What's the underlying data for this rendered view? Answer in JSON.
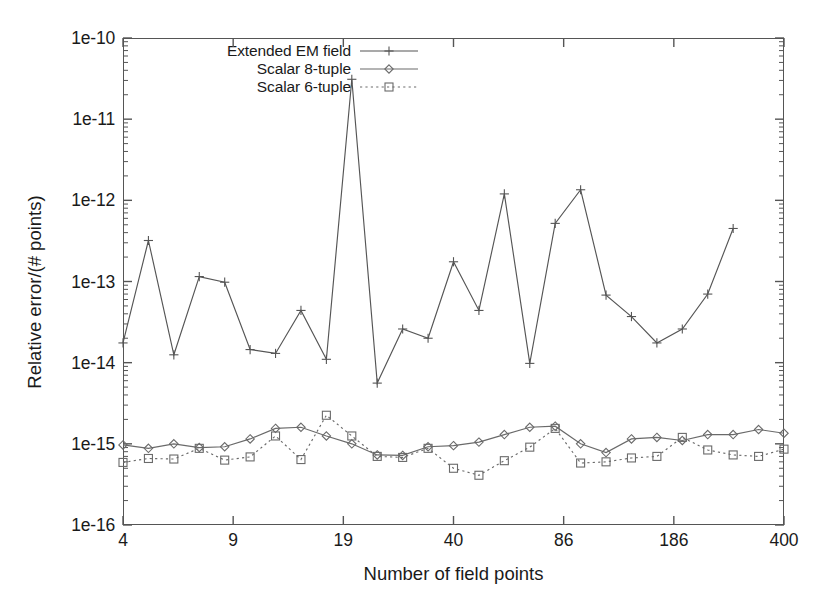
{
  "chart_data": {
    "type": "line",
    "title": "",
    "xlabel": "Number of field points",
    "ylabel": "Relative error/(# points)",
    "xscale": "log-category",
    "yscale": "log",
    "ylim": [
      1e-16,
      1e-10
    ],
    "xtick_labels": [
      "4",
      "9",
      "19",
      "40",
      "86",
      "186",
      "400"
    ],
    "ytick_labels": [
      "1e-10",
      "1e-11",
      "1e-12",
      "1e-13",
      "1e-14",
      "1e-15",
      "1e-16"
    ],
    "ytick_values": [
      1e-10,
      1e-11,
      1e-12,
      1e-13,
      1e-14,
      1e-15,
      1e-16
    ],
    "grid": false,
    "minor_ticks": true,
    "legend_position": "top-center-inside",
    "x_index": [
      0,
      1,
      2,
      3,
      4,
      5,
      6,
      7,
      8,
      9,
      10,
      11,
      12,
      13,
      14,
      15,
      16,
      17,
      18,
      19,
      20,
      21,
      22,
      23,
      24,
      25,
      26
    ],
    "series": [
      {
        "name": "Extended EM field",
        "marker": "plus",
        "linestyle": "solid",
        "color": "#555555",
        "values": [
          1.75e-14,
          3.2e-13,
          1.25e-14,
          1.15e-13,
          9.8e-14,
          1.45e-14,
          1.3e-14,
          4.4e-14,
          1.1e-14,
          3.1e-11,
          5.6e-15,
          2.6e-14,
          2e-14,
          1.75e-13,
          4.4e-14,
          1.2e-12,
          9.8e-15,
          5.2e-13,
          1.35e-12,
          6.8e-14,
          3.7e-14,
          1.75e-14,
          2.6e-14,
          7e-14,
          4.5e-13
        ]
      },
      {
        "name": "Scalar 8-tuple",
        "marker": "diamond",
        "linestyle": "solid",
        "color": "#6a6a6a",
        "values": [
          9.7e-16,
          8.8e-16,
          1e-15,
          9e-16,
          9.2e-16,
          1.15e-15,
          1.55e-15,
          1.6e-15,
          1.25e-15,
          1e-15,
          7.3e-16,
          7.2e-16,
          9.2e-16,
          9.5e-16,
          1.05e-15,
          1.3e-15,
          1.6e-15,
          1.65e-15,
          1e-15,
          7.8e-16,
          1.15e-15,
          1.2e-15,
          1.1e-15,
          1.3e-15,
          1.3e-15,
          1.5e-15,
          1.35e-15
        ]
      },
      {
        "name": "Scalar 6-tuple",
        "marker": "square",
        "linestyle": "dotted",
        "color": "#6a6a6a",
        "values": [
          5.9e-16,
          6.6e-16,
          6.5e-16,
          8.8e-16,
          6.3e-16,
          6.9e-16,
          1.25e-15,
          6.4e-16,
          2.25e-15,
          1.25e-15,
          7e-16,
          6.8e-16,
          8.8e-16,
          5e-16,
          4.1e-16,
          6.2e-16,
          9.1e-16,
          1.55e-15,
          5.8e-16,
          6e-16,
          6.7e-16,
          7e-16,
          1.2e-15,
          8.4e-16,
          7.3e-16,
          7e-16,
          8.6e-16
        ]
      }
    ]
  },
  "axes": {
    "y_title": "Relative error/(# points)",
    "x_title": "Number of field points"
  }
}
